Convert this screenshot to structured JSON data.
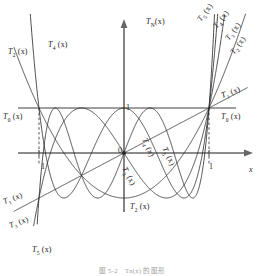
{
  "figure": {
    "caption": "图 5-2　Tn(x) 的图形",
    "axis_labels": {
      "y": "T",
      "y_sub": "N",
      "y_arg": "(x)",
      "x": "x"
    },
    "ticks": {
      "origin": "0",
      "y_one": "1",
      "x_left": "1",
      "x_right": "1"
    }
  },
  "curve_labels": [
    {
      "id": "T2-top-left",
      "base": "T",
      "sub": "2",
      "arg": "(x)",
      "x": 8,
      "y": 48,
      "rot": 0
    },
    {
      "id": "T4-top-left",
      "base": "T",
      "sub": "4",
      "arg": "(x)",
      "x": 48,
      "y": 41,
      "rot": 0
    },
    {
      "id": "T0-left",
      "base": "T",
      "sub": "0",
      "arg": "(x)",
      "x": 3,
      "y": 113,
      "rot": 0
    },
    {
      "id": "T1-bottom-left",
      "base": "T",
      "sub": "1",
      "arg": "(x)",
      "x": 4,
      "y": 198,
      "rot": -20
    },
    {
      "id": "T3-bottom-left",
      "base": "T",
      "sub": "3",
      "arg": "(x)",
      "x": 10,
      "y": 222,
      "rot": -20
    },
    {
      "id": "T5-bottom",
      "base": "T",
      "sub": "5",
      "arg": "(x)",
      "x": 32,
      "y": 246,
      "rot": 0
    },
    {
      "id": "T2-bottom-mid",
      "base": "T",
      "sub": "2",
      "arg": "(x)",
      "x": 130,
      "y": 203,
      "rot": 0
    },
    {
      "id": "T3-inner",
      "base": "T",
      "sub": "3",
      "arg": "(x)",
      "x": 123,
      "y": 163,
      "rot": 62
    },
    {
      "id": "T4-inner",
      "base": "T",
      "sub": "4",
      "arg": "(x)",
      "x": 143,
      "y": 134,
      "rot": 66
    },
    {
      "id": "T5-inner",
      "base": "T",
      "sub": "5",
      "arg": "(x)",
      "x": 163,
      "y": 143,
      "rot": 64
    },
    {
      "id": "T5-top-right",
      "base": "T",
      "sub": "5",
      "arg": "(x)",
      "x": 200,
      "y": 16,
      "rot": -52
    },
    {
      "id": "T4-top-right",
      "base": "T",
      "sub": "4",
      "arg": "(x)",
      "x": 216,
      "y": 23,
      "rot": -52
    },
    {
      "id": "T3-top-right",
      "base": "T",
      "sub": "3",
      "arg": "(x)",
      "x": 228,
      "y": 35,
      "rot": -52
    },
    {
      "id": "T2-top-right",
      "base": "T",
      "sub": "2",
      "arg": "(x)",
      "x": 233,
      "y": 49,
      "rot": -52
    },
    {
      "id": "T1-right",
      "base": "T",
      "sub": "1",
      "arg": "(x)",
      "x": 222,
      "y": 92,
      "rot": -21
    },
    {
      "id": "T0-right",
      "base": "T",
      "sub": "0",
      "arg": "(x)",
      "x": 221,
      "y": 113,
      "rot": 0
    }
  ],
  "chart_data": {
    "type": "line",
    "xlabel": "x",
    "ylabel": "TN(x)",
    "xlim": [
      -1.45,
      1.45
    ],
    "ylim": [
      -1.75,
      1.9
    ],
    "grid": false,
    "legend": "inline-curve-labels",
    "reference_lines": [
      {
        "name": "y=1",
        "type": "horizontal",
        "value": 1
      },
      {
        "name": "x=-1",
        "type": "vertical-dashed",
        "value": -1
      },
      {
        "name": "x=1",
        "type": "vertical-dashed",
        "value": 1
      }
    ],
    "series": [
      {
        "name": "T0(x)",
        "degree": 0,
        "formula": "1"
      },
      {
        "name": "T1(x)",
        "degree": 1,
        "formula": "x"
      },
      {
        "name": "T2(x)",
        "degree": 2,
        "formula": "2x^2 - 1"
      },
      {
        "name": "T3(x)",
        "degree": 3,
        "formula": "4x^3 - 3x"
      },
      {
        "name": "T4(x)",
        "degree": 4,
        "formula": "8x^4 - 8x^2 + 1"
      },
      {
        "name": "T5(x)",
        "degree": 5,
        "formula": "16x^5 - 20x^3 + 5x"
      }
    ],
    "colors": {
      "curve": "#2b2b2b",
      "axis": "#666666",
      "label": "#1d1d1d"
    }
  }
}
